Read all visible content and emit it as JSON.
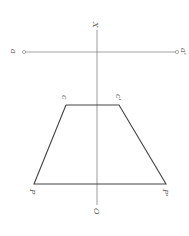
{
  "diagram": {
    "labels": {
      "x_axis": "X",
      "origin": "O",
      "a_left": "a",
      "a_right": "a'",
      "c_left": "c",
      "c_right": "c'",
      "p_left": "P",
      "p_right": "P'"
    },
    "colors": {
      "axis": "#9a9a9a",
      "trapezoid": "#444444",
      "line_a": "#8a8a8a"
    }
  }
}
